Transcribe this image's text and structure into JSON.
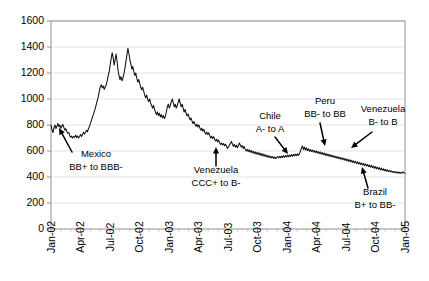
{
  "chart_data": {
    "type": "line",
    "title": "",
    "xlabel": "",
    "ylabel": "",
    "ylim": [
      0,
      1600
    ],
    "ytick_labels": [
      "0",
      "200",
      "400",
      "600",
      "800",
      "1000",
      "1200",
      "1400",
      "1600"
    ],
    "ytick_values": [
      0,
      200,
      400,
      600,
      800,
      1000,
      1200,
      1400,
      1600
    ],
    "grid": true,
    "legend": "none",
    "xtick_labels": [
      "Jan-02",
      "Apr-02",
      "Jul-02",
      "Oct-02",
      "Jan-03",
      "Apr-03",
      "Jul-03",
      "Oct-03",
      "Jan-04",
      "Apr-04",
      "Jul-04",
      "Oct-04",
      "Jan-05"
    ],
    "x_start": "Jan-02",
    "x_end": "Jan-05",
    "series": [
      {
        "name": "spread-index",
        "values": [
          800,
          765,
          742,
          780,
          800,
          772,
          790,
          812,
          786,
          800,
          775,
          790,
          805,
          782,
          760,
          772,
          752,
          736,
          742,
          720,
          706,
          714,
          700,
          712,
          706,
          722,
          704,
          716,
          700,
          712,
          726,
          712,
          726,
          744,
          730,
          744,
          760,
          748,
          772,
          790,
          812,
          836,
          862,
          880,
          906,
          930,
          960,
          990,
          1020,
          1060,
          1096,
          1110,
          1086,
          1100,
          1074,
          1092,
          1110,
          1140,
          1180,
          1210,
          1260,
          1310,
          1356,
          1320,
          1260,
          1300,
          1346,
          1290,
          1220,
          1180,
          1150,
          1172,
          1140,
          1160,
          1196,
          1240,
          1290,
          1340,
          1390,
          1350,
          1300,
          1270,
          1230,
          1250,
          1210,
          1180,
          1200,
          1160,
          1130,
          1150,
          1120,
          1090,
          1070,
          1090,
          1060,
          1030,
          1010,
          1030,
          1000,
          980,
          1000,
          970,
          950,
          930,
          950,
          920,
          900,
          880,
          900,
          872,
          890,
          862,
          880,
          856,
          872,
          850,
          866,
          900,
          940,
          960,
          930,
          950,
          980,
          1000,
          970,
          940,
          960,
          930,
          950,
          975,
          1000,
          970,
          940,
          960,
          930,
          900,
          920,
          890,
          870,
          885,
          860,
          840,
          855,
          830,
          812,
          828,
          806,
          790,
          806,
          784,
          800,
          776,
          760,
          775,
          752,
          766,
          744,
          730,
          745,
          726,
          740,
          718,
          700,
          714,
          696,
          710,
          690,
          676,
          690,
          670,
          684,
          664,
          650,
          662,
          646,
          658,
          640,
          652,
          636,
          620,
          632,
          646,
          660,
          674,
          652,
          636,
          650,
          630,
          644,
          624,
          640,
          662,
          646,
          630,
          642,
          620,
          634,
          612,
          600,
          614,
          596,
          610,
          590,
          604,
          586,
          598,
          580,
          594,
          576,
          590,
          572,
          586,
          568,
          582,
          564,
          578,
          560,
          572,
          556,
          568,
          552,
          564,
          548,
          560,
          546,
          558,
          542,
          554,
          540,
          552,
          558,
          546,
          560,
          548,
          562,
          550,
          564,
          552,
          566,
          554,
          568,
          556,
          570,
          558,
          572,
          560,
          574,
          562,
          576,
          564,
          578,
          566,
          580,
          600,
          622,
          640,
          612,
          630,
          608,
          624,
          604,
          618,
          598,
          612,
          596,
          608,
          592,
          604,
          588,
          600,
          584,
          596,
          580,
          592,
          576,
          588,
          572,
          584,
          568,
          580,
          564,
          576,
          560,
          572,
          556,
          568,
          552,
          564,
          548,
          560,
          544,
          556,
          540,
          552,
          536,
          548,
          532,
          544,
          528,
          540,
          524,
          536,
          520,
          532,
          516,
          528,
          512,
          524,
          508,
          520,
          504,
          516,
          500,
          512,
          496,
          508,
          492,
          504,
          488,
          500,
          484,
          496,
          480,
          492,
          476,
          488,
          472,
          484,
          468,
          480,
          464,
          476,
          460,
          472,
          456,
          468,
          452,
          464,
          448,
          460,
          444,
          456,
          442,
          452,
          440,
          448,
          436,
          444,
          434,
          442,
          432,
          440,
          430,
          438,
          428,
          436,
          430,
          440,
          432,
          428
        ]
      }
    ],
    "annotations": [
      {
        "id": "mexico",
        "line1": "Mexico",
        "line2": "BB+ to BBB-",
        "text_x": 96,
        "text_y1": 157,
        "text_y2": 170,
        "arrow_from_x": 72,
        "arrow_from_y": 152,
        "arrow_to_x": 59,
        "arrow_to_y": 128,
        "head": "up-left"
      },
      {
        "id": "venezuela-ccc",
        "line1": "Venezuela",
        "line2": "CCC+ to B-",
        "text_x": 216,
        "text_y1": 173,
        "text_y2": 186,
        "arrow_from_x": 216,
        "arrow_from_y": 166,
        "arrow_to_x": 216,
        "arrow_to_y": 147,
        "head": "up"
      },
      {
        "id": "chile",
        "line1": "Chile",
        "line2": "A- to A",
        "text_x": 270,
        "text_y1": 119,
        "text_y2": 132,
        "arrow_from_x": 275,
        "arrow_from_y": 137,
        "arrow_to_x": 288,
        "arrow_to_y": 154,
        "head": "down-right"
      },
      {
        "id": "peru",
        "line1": "Peru",
        "line2": "BB- to BB",
        "text_x": 325,
        "text_y1": 104,
        "text_y2": 117,
        "arrow_from_x": 320,
        "arrow_from_y": 123,
        "arrow_to_x": 325,
        "arrow_to_y": 146,
        "head": "down"
      },
      {
        "id": "venezuela-b",
        "line1": "Venezuela",
        "line2": "B- to B",
        "text_x": 383,
        "text_y1": 112,
        "text_y2": 125,
        "arrow_from_x": 372,
        "arrow_from_y": 132,
        "arrow_to_x": 351,
        "arrow_to_y": 148,
        "head": "down-left"
      },
      {
        "id": "brazil",
        "line1": "Brazil",
        "line2": "B+ to BB-",
        "text_x": 375,
        "text_y1": 195,
        "text_y2": 208,
        "arrow_from_x": 368,
        "arrow_from_y": 188,
        "arrow_to_x": 362,
        "arrow_to_y": 167,
        "head": "up"
      }
    ]
  }
}
